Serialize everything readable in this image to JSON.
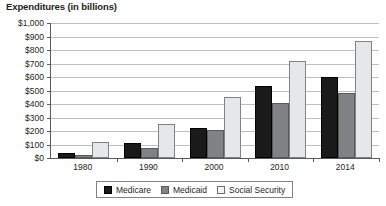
{
  "chart_data": {
    "type": "bar",
    "title": "Expenditures (in billions)",
    "xlabel": "",
    "ylabel": "",
    "categories": [
      "1980",
      "1990",
      "2000",
      "2010",
      "2014"
    ],
    "series": [
      {
        "name": "Medicare",
        "color": "#1a1a1a",
        "values": [
          35,
          110,
          222,
          530,
          600
        ]
      },
      {
        "name": "Medicaid",
        "color": "#808285",
        "values": [
          26,
          73,
          208,
          410,
          478
        ]
      },
      {
        "name": "Social Security",
        "color": "#e6e7e8",
        "values": [
          118,
          250,
          455,
          715,
          870
        ]
      }
    ],
    "ylim": [
      0,
      1000
    ],
    "ytick_values": [
      0,
      100,
      200,
      300,
      400,
      500,
      600,
      700,
      800,
      900,
      1000
    ],
    "ytick_labels": [
      "$0",
      "$100",
      "$200",
      "$300",
      "$400",
      "$500",
      "$600",
      "$700",
      "$800",
      "$900",
      "$1,000"
    ],
    "grid": true,
    "legend_position": "bottom"
  },
  "legend": {
    "entries": [
      {
        "label": "Medicare"
      },
      {
        "label": "Medicaid"
      },
      {
        "label": "Social Security"
      }
    ]
  }
}
